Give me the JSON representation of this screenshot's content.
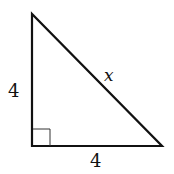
{
  "diagram": {
    "type": "right-triangle",
    "labels": {
      "left_leg": "4",
      "bottom_leg": "4",
      "hypotenuse": "x"
    },
    "right_angle_marker": true,
    "colors": {
      "stroke": "#111111",
      "background": "#ffffff"
    }
  }
}
